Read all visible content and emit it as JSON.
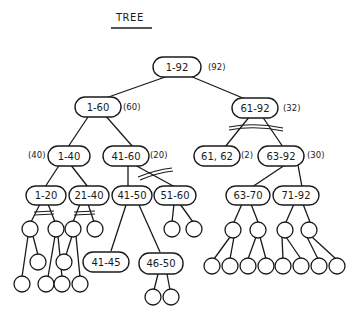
{
  "title": "TREE",
  "colors": {
    "ink": "#1a1a1a",
    "background": "#ffffff"
  },
  "nodes": {
    "root": {
      "label": "1-92",
      "count": "(92)"
    },
    "n1_60": {
      "label": "1-60",
      "count": "(60)"
    },
    "n61_92": {
      "label": "61-92",
      "count": "(32)"
    },
    "n1_40": {
      "label": "1-40",
      "count": "(40)"
    },
    "n41_60": {
      "label": "41-60",
      "count": "(20)"
    },
    "n61_62": {
      "label": "61, 62",
      "count": "(2)"
    },
    "n63_92": {
      "label": "63-92",
      "count": "(30)"
    },
    "n1_20": {
      "label": "1-20"
    },
    "n21_40": {
      "label": "21-40"
    },
    "n41_50": {
      "label": "41-50"
    },
    "n51_60": {
      "label": "51-60"
    },
    "n63_70": {
      "label": "63-70"
    },
    "n71_92": {
      "label": "71-92"
    },
    "n41_45": {
      "label": "41-45"
    },
    "n46_50": {
      "label": "46-50"
    }
  }
}
